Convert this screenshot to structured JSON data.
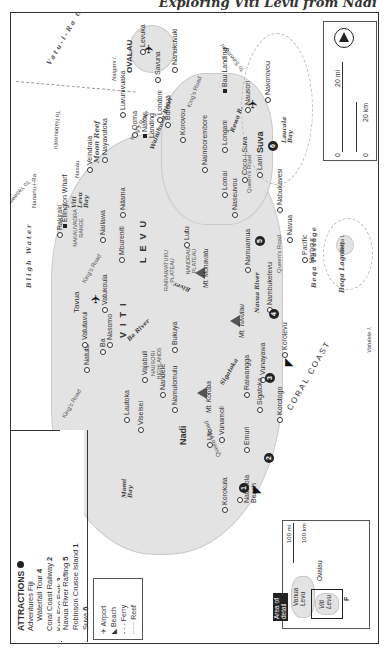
{
  "page": {
    "title": "Exploring Viti Levu from Nadi"
  },
  "attractions": {
    "heading": "ATTRACTIONS",
    "items": [
      {
        "name": "Adventures Fiji",
        "sub": "Waterfall Tour",
        "num": "4"
      },
      {
        "name": "Coral Coast Railway",
        "num": "2"
      },
      {
        "name": "Kula Eco Park",
        "num": "3"
      },
      {
        "name": "Navua River Rafting",
        "num": "5"
      },
      {
        "name": "Robinson Crusoe Island",
        "num": "1"
      },
      {
        "name": "Suva",
        "num": "6"
      }
    ]
  },
  "key": {
    "items": [
      {
        "icon": "airport-icon",
        "label": "Airport"
      },
      {
        "icon": "beach-icon",
        "label": "Beach"
      },
      {
        "icon": "ferry-icon",
        "label": "Ferry"
      },
      {
        "icon": "reef-icon",
        "label": "Reef"
      }
    ]
  },
  "inset": {
    "callout": "Area of detail",
    "labels": {
      "vanua_levu": "Vanua Levu",
      "viti_levu": "Viti Levu",
      "ovalau": "Ovalau",
      "fiji": "F"
    },
    "scale_mi": "100 mi",
    "scale_km": "100 km",
    "zero": "0"
  },
  "scale": {
    "mi": "20 mi",
    "km": "20 km",
    "zero": "0"
  },
  "compass": {
    "label": "N"
  },
  "waters": {
    "vatu_i_ra": "Vatu-i-Ra Channel",
    "bligh_water": "Bligh Water",
    "bligh_water_2": "Bligh Water",
    "coral_coast": "CORAL COAST",
    "beqa_passage": "Beqa Passage",
    "beqa_lagoon": "Beqa Lagoon",
    "moon_reef": "Moon Reef"
  },
  "ferry_routes": {
    "to_nabouwalu": "To Nabouwalu",
    "to_savusavu": "To Savusavu",
    "to_yasawa": "To Yasawas"
  },
  "regions": {
    "viti": "VITI",
    "levu": "LEVU",
    "ovalau": "OVALAU",
    "yasawa": "YASAWA ISLANDS",
    "mamanuca": "MAMANUCA ISLANDS",
    "nakauvadra": "NAKAUVADRA RANGE",
    "rairaimatuku": "RAIRAIMATUKU PLATEAU",
    "nandrau": "NANDRAU PLATEAU",
    "nausori_highlands": "NAUSORI HIGHLANDS"
  },
  "mountains": {
    "monavatu": "Mt. Monavatu",
    "tuvutau": "Mt. Tuvutau",
    "koroba": "Mt. Koroba"
  },
  "rivers": {
    "wainibuka": "Wainibuka River",
    "rewa": "Rewa R.",
    "ba": "Ba River",
    "sigatoka": "Sigatoka",
    "navua": "Navua River",
    "wainimala": "River"
  },
  "roads": {
    "kings_1": "King's Road",
    "kings_2": "King's Road",
    "kings_3": "King's Road",
    "kings_4": "King's Road",
    "queens_1": "Queen's Road",
    "queens_2": "Queen's Road",
    "queens_3": "Queen's Road"
  },
  "islands": {
    "naigani": "Naigani I.",
    "waya": "Waya I.",
    "mana": "Mana I.",
    "malolo": "Malolo I.",
    "malololailai": "Malololailai I.",
    "beqa": "Beqa I.",
    "vatulele": "Vatulele I.",
    "nananu": "Nananu-i-Ra"
  },
  "bays": {
    "laucala": "Laucala Bay",
    "momi": "Momi Bay",
    "viti_levu_bay": "Viti Levu Bay",
    "vuda": "Vuda Pt."
  },
  "towns": {
    "levuka": "Levuka",
    "savuna": "Savuna",
    "nanukuvuki": "Nanukuvuki",
    "londoni": "Londoni",
    "burerua": "Burerua",
    "natovi": "Natovi Landing",
    "bau": "Bau Landing",
    "nakorovou": "Nakorovou",
    "nausori": "Nausori",
    "suva": "Suva",
    "qoma": "Qoma",
    "luvunivuaka": "Luvunivuaka",
    "nayavutoka": "Nayavutoka",
    "vaileka": "Veindraia",
    "nasau": "Nasau",
    "korovou": "Korovou",
    "naimbore": "Naimborembore",
    "longani": "Longani",
    "coco": "Coco-i-Suva",
    "lami": "Lami",
    "lomai": "Lomai",
    "naseuvou": "Naseuvou",
    "nabukavesi": "Nabukavesi",
    "navua": "Navua",
    "pacific_harbour": "Pacific Harbour",
    "namuamua": "Namuamua",
    "nambukelevu": "Nambukelevu",
    "korolevu": "Korolevu",
    "vunayawa": "Vunayawa",
    "raiwangga": "Raiwangga",
    "korotogo": "Korotogo",
    "sigatoka": "Sigatoka",
    "emuri": "Emuri",
    "natadola": "Natadola Beach",
    "korokula": "Korokula",
    "uto": "Uto",
    "vunamoli": "Vunamoli",
    "nadi": "Nadi",
    "namulomulu": "Namulomulu",
    "nandele": "Nandele",
    "bukuya": "Bukuya",
    "vajabuli": "Vajabuli",
    "lautoka": "Lautoka",
    "viseisei": "Viseisei",
    "natutu": "Natutu",
    "ba": "Ba",
    "vatutavui": "Vatutavui",
    "tavua": "Tavua",
    "nasomo": "Nasomo",
    "vatukoula": "Vatukoula",
    "nailawa": "Nailawa",
    "mbureniti": "Mbureniti",
    "ndama": "Ndama",
    "lutu": "Lutu",
    "rakiraki": "Rakiraki",
    "ellington": "Ellington Wharf"
  }
}
